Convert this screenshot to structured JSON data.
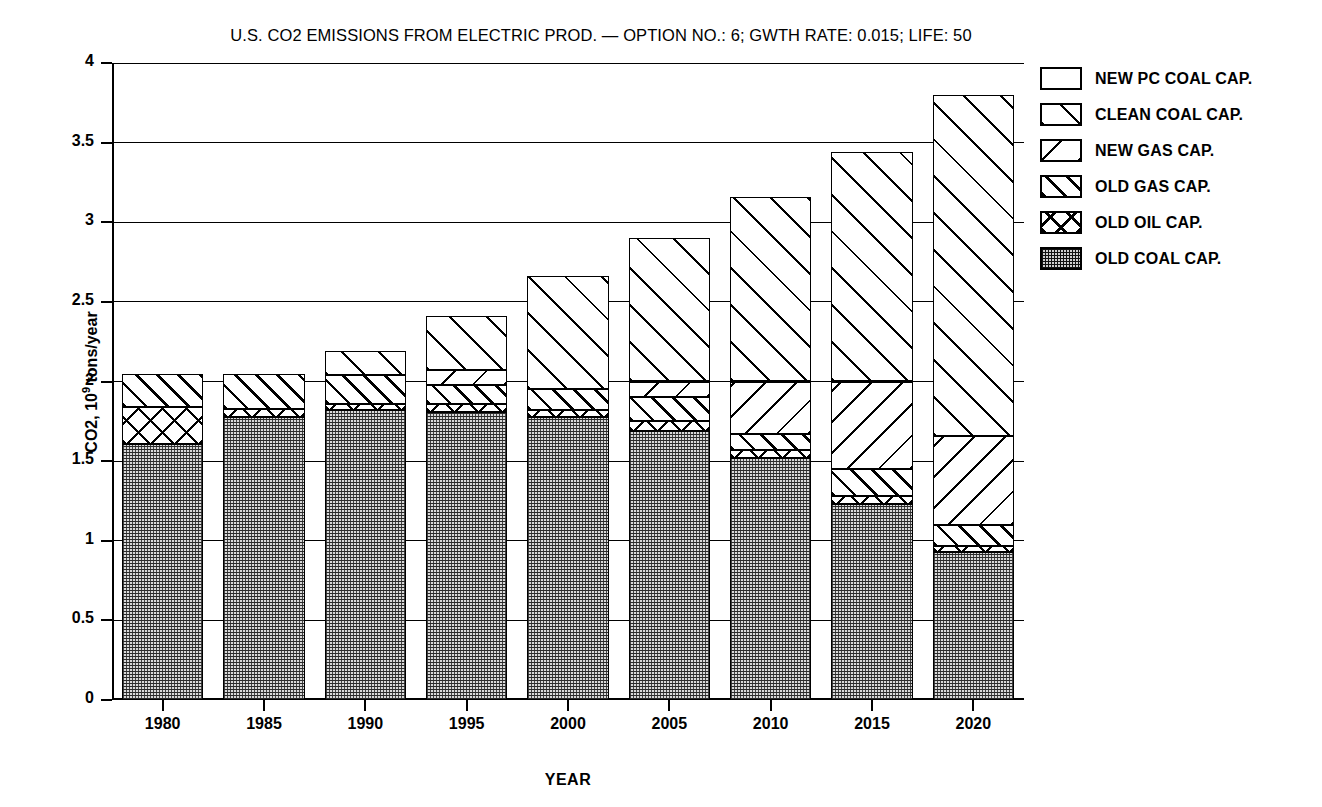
{
  "chart_data": {
    "type": "bar",
    "subtype": "stacked",
    "title": "U.S. CO2 EMISSIONS FROM ELECTRIC PROD. — OPTION NO.: 6; GWTH RATE: 0.015; LIFE: 50",
    "xlabel": "YEAR",
    "ylabel": "CO2, 10^9 tons/year",
    "ylabel_prefix": "CO2, 10",
    "ylabel_exponent": "9",
    "ylabel_suffix": " tons/year",
    "ylim": [
      0,
      4
    ],
    "yticks": [
      "0",
      "0.5",
      "1",
      "1.5",
      "2",
      "2.5",
      "3",
      "3.5",
      "4"
    ],
    "ytick_values": [
      0,
      0.5,
      1,
      1.5,
      2,
      2.5,
      3,
      3.5,
      4
    ],
    "grid": "horizontal",
    "legend_position": "right",
    "categories": [
      "1980",
      "1985",
      "1990",
      "1995",
      "2000",
      "2005",
      "2010",
      "2015",
      "2020"
    ],
    "series": [
      {
        "name": "OLD COAL CAP.",
        "pattern": "old-coal",
        "values": [
          1.61,
          1.78,
          1.82,
          1.81,
          1.78,
          1.69,
          1.52,
          1.23,
          0.93
        ]
      },
      {
        "name": "OLD OIL CAP.",
        "pattern": "old-oil",
        "values": [
          0.23,
          0.05,
          0.04,
          0.05,
          0.04,
          0.06,
          0.05,
          0.05,
          0.04
        ]
      },
      {
        "name": "OLD GAS CAP.",
        "pattern": "old-gas",
        "values": [
          0.21,
          0.22,
          0.18,
          0.12,
          0.13,
          0.15,
          0.1,
          0.17,
          0.13
        ]
      },
      {
        "name": "NEW GAS CAP.",
        "pattern": "new-gas",
        "values": [
          0.0,
          0.0,
          0.0,
          0.09,
          0.0,
          0.1,
          0.33,
          0.55,
          0.56
        ]
      },
      {
        "name": "CLEAN COAL CAP.",
        "pattern": "clean-coal",
        "values": [
          0.0,
          0.0,
          0.15,
          0.34,
          0.71,
          0.9,
          1.16,
          1.44,
          2.14
        ]
      },
      {
        "name": "NEW PC COAL CAP.",
        "pattern": "blank",
        "values": [
          0.0,
          0.0,
          0.0,
          0.0,
          0.0,
          0.0,
          0.0,
          0.0,
          0.0
        ]
      }
    ],
    "totals": [
      2.05,
      2.05,
      2.19,
      2.41,
      2.66,
      2.9,
      3.16,
      3.44,
      3.8
    ]
  },
  "legend": {
    "items": [
      {
        "label": "NEW PC COAL CAP.",
        "pattern": "blank"
      },
      {
        "label": "CLEAN COAL CAP.",
        "pattern": "clean-coal"
      },
      {
        "label": "NEW GAS CAP.",
        "pattern": "new-gas"
      },
      {
        "label": "OLD GAS CAP.",
        "pattern": "old-gas"
      },
      {
        "label": "OLD OIL CAP.",
        "pattern": "old-oil"
      },
      {
        "label": "OLD COAL CAP.",
        "pattern": "old-coal"
      }
    ]
  },
  "colors": {
    "ink": "#000000",
    "background": "#ffffff",
    "old_coal_fill": "#d9d9d9"
  }
}
